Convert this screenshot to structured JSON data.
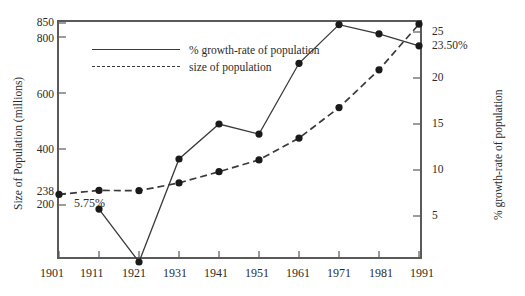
{
  "chart_data": {
    "type": "line",
    "title": "",
    "xlabel": "",
    "ylabel": "Size of Population (millions)",
    "y2label": "% growth-rate of population",
    "x": [
      1901,
      1911,
      1921,
      1931,
      1941,
      1951,
      1961,
      1971,
      1981,
      1991
    ],
    "categories": [
      "1901",
      "1911",
      "1921",
      "1931",
      "1941",
      "1951",
      "1961",
      "1971",
      "1981",
      "1991"
    ],
    "xticklabels": [
      "1901",
      "1911",
      "1921",
      "1931",
      "1941",
      "1951",
      "1961",
      "1971",
      "1981",
      "1991"
    ],
    "yticklabels": [
      "850",
      "800",
      "600",
      "400",
      "238",
      "200"
    ],
    "ytickvalues": [
      850,
      800,
      600,
      400,
      238,
      200
    ],
    "ylim": [
      0,
      900
    ],
    "y2ticklabels": [
      "25",
      "23.50%",
      "20",
      "15",
      "10",
      "5"
    ],
    "y2tickvalues": [
      25,
      23.5,
      20,
      15,
      10,
      5
    ],
    "y2lim": [
      0,
      27.5
    ],
    "grid": false,
    "legend_position": "upper-left-inside",
    "series": [
      {
        "name": "% growth-rate of population",
        "axis": "right",
        "style": "solid",
        "marker": "filled-circle",
        "values": [
          null,
          5.75,
          0.0,
          11.2,
          15.0,
          13.9,
          21.6,
          25.8,
          24.8,
          23.5
        ]
      },
      {
        "name": "size of population",
        "axis": "left",
        "style": "dashed",
        "marker": "filled-circle",
        "values": [
          238,
          252,
          251,
          279,
          319,
          361,
          439,
          548,
          683,
          846
        ]
      }
    ],
    "annotations": [
      {
        "text": "5.75%",
        "near_x": 1911,
        "series": "% growth-rate of population"
      },
      {
        "text": "238",
        "near_x": 1901,
        "series": "size of population"
      },
      {
        "text": "23.50%",
        "near_x": 1991,
        "series": "% growth-rate of population"
      }
    ],
    "legend": [
      "% growth-rate of population",
      "size of population"
    ],
    "colors": {
      "line": "#3a3a3a",
      "marker": "#1a1a1a",
      "frame": "#5a5a5a",
      "text": "#2b2b2b"
    }
  },
  "axes": {
    "left_title": "Size of Population (millions)",
    "right_title": "% growth-rate of population"
  },
  "labels": {
    "y_850": "850",
    "y_800": "800",
    "y_600": "600",
    "y_400": "400",
    "y_238": "238",
    "y_200": "200",
    "y2_25": "25",
    "y2_2350": "23.50%",
    "y2_20": "20",
    "y2_15": "15",
    "y2_10": "10",
    "y2_5": "5",
    "x_1901": "1901",
    "x_1911": "1911",
    "x_1921": "1921",
    "x_1931": "1931",
    "x_1941": "1941",
    "x_1951": "1951",
    "x_1961": "1961",
    "x_1971": "1971",
    "x_1981": "1981",
    "x_1991": "1991",
    "annot_575": "5.75%"
  },
  "legend": {
    "growth_label": "% growth-rate of population",
    "population_label": "size of population"
  }
}
